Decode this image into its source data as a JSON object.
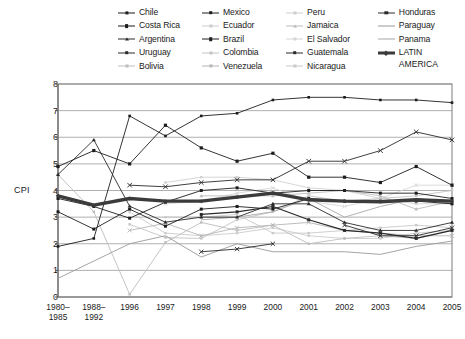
{
  "chart_data": {
    "type": "line",
    "title": "",
    "xlabel": "",
    "ylabel": "CPI",
    "ylim": [
      0,
      8
    ],
    "yticks": [
      0,
      1,
      2,
      3,
      4,
      5,
      6,
      7,
      8
    ],
    "grid": true,
    "legend_position": "top",
    "categories": [
      "1980–\n1985",
      "1988–\n1992",
      "1996",
      "1997",
      "1998",
      "1999",
      "2000",
      "2001",
      "2002",
      "2003",
      "2004",
      "2005"
    ],
    "category_labels": [
      [
        "1980–",
        "1985"
      ],
      [
        "1988–",
        "1992"
      ],
      [
        "1996",
        ""
      ],
      [
        "1997",
        ""
      ],
      [
        "1998",
        ""
      ],
      [
        "1999",
        ""
      ],
      [
        "2000",
        ""
      ],
      [
        "2001",
        ""
      ],
      [
        "2002",
        ""
      ],
      [
        "2003",
        ""
      ],
      [
        "2004",
        ""
      ],
      [
        "2005",
        ""
      ]
    ],
    "series": [
      {
        "name": "Chile",
        "color": "#1d1d1d",
        "width": 0.9,
        "marker": "square",
        "markersize": 2.6,
        "values": [
          1.9,
          2.2,
          6.8,
          6.05,
          6.8,
          6.9,
          7.4,
          7.5,
          7.5,
          7.4,
          7.4,
          7.3
        ]
      },
      {
        "name": "Costa Rica",
        "color": "#1d1d1d",
        "width": 0.9,
        "marker": "square",
        "markersize": 3.2,
        "values": [
          4.9,
          5.5,
          5.0,
          6.45,
          5.6,
          5.1,
          5.4,
          4.5,
          4.5,
          4.3,
          4.9,
          4.2
        ]
      },
      {
        "name": "Argentina",
        "color": "#2a2a2a",
        "width": 0.9,
        "marker": "triangle",
        "markersize": 2.8,
        "values": [
          4.6,
          5.9,
          3.41,
          2.81,
          3.0,
          3.0,
          3.5,
          3.5,
          2.8,
          2.5,
          2.5,
          2.8
        ]
      },
      {
        "name": "Uruguay",
        "color": "#2a2a2a",
        "width": 0.9,
        "marker": "cross",
        "markersize": 3.0,
        "values": [
          null,
          null,
          4.2,
          4.14,
          4.3,
          4.4,
          4.4,
          5.1,
          5.1,
          5.5,
          6.2,
          5.9
        ]
      },
      {
        "name": "Bolivia",
        "color": "#bdbdbd",
        "width": 0.9,
        "marker": "square",
        "markersize": 2.4,
        "values": [
          4.6,
          3.2,
          0.1,
          2.05,
          2.8,
          2.5,
          2.7,
          2.0,
          2.2,
          2.3,
          2.2,
          2.5
        ]
      },
      {
        "name": "Mexico",
        "color": "#1d1d1d",
        "width": 0.9,
        "marker": "square",
        "markersize": 3.0,
        "values": [
          3.2,
          2.55,
          3.3,
          2.66,
          3.3,
          3.4,
          3.3,
          3.7,
          3.6,
          3.6,
          3.6,
          3.5
        ]
      },
      {
        "name": "Ecuador",
        "color": "#cccccc",
        "width": 0.9,
        "marker": "square",
        "markersize": 2.4,
        "values": [
          null,
          null,
          3.19,
          2.4,
          2.3,
          2.4,
          2.6,
          2.3,
          2.2,
          2.2,
          2.4,
          2.5
        ]
      },
      {
        "name": "Brazil",
        "color": "#1d1d1d",
        "width": 0.9,
        "marker": "square",
        "markersize": 3.0,
        "values": [
          3.7,
          3.4,
          2.96,
          3.56,
          4.0,
          4.1,
          3.9,
          4.0,
          4.0,
          3.9,
          3.9,
          3.7
        ]
      },
      {
        "name": "Colombia",
        "color": "#c4c4c4",
        "width": 0.9,
        "marker": "square",
        "markersize": 2.4,
        "values": [
          null,
          null,
          2.73,
          2.23,
          2.2,
          2.9,
          3.2,
          3.8,
          3.6,
          3.7,
          3.8,
          4.0
        ]
      },
      {
        "name": "Venezuela",
        "color": "#b5b5b5",
        "width": 0.9,
        "marker": "cross",
        "markersize": 2.6,
        "values": [
          null,
          null,
          2.5,
          2.77,
          2.3,
          2.6,
          2.7,
          2.8,
          2.5,
          2.4,
          2.3,
          2.3
        ]
      },
      {
        "name": "Peru",
        "color": "#d0d0d0",
        "width": 0.9,
        "marker": "square",
        "markersize": 2.4,
        "values": [
          null,
          null,
          null,
          4.3,
          4.5,
          4.5,
          4.4,
          4.1,
          4.0,
          3.7,
          3.5,
          3.5
        ]
      },
      {
        "name": "Jamaica",
        "color": "#bcbcbc",
        "width": 0.9,
        "marker": "triangle",
        "markersize": 2.6,
        "values": [
          null,
          null,
          null,
          null,
          3.8,
          3.8,
          3.8,
          3.9,
          4.0,
          3.8,
          3.3,
          3.6
        ]
      },
      {
        "name": "El Salvador",
        "color": "#d6d6d6",
        "width": 0.9,
        "marker": "cross",
        "markersize": 2.4,
        "values": [
          null,
          null,
          null,
          3.5,
          3.6,
          3.9,
          4.1,
          3.6,
          3.4,
          3.7,
          4.2,
          4.2
        ]
      },
      {
        "name": "Guatemala",
        "color": "#2a2a2a",
        "width": 1.2,
        "marker": "square",
        "markersize": 3.0,
        "values": [
          null,
          null,
          null,
          null,
          3.1,
          3.2,
          3.4,
          2.9,
          2.5,
          2.4,
          2.2,
          2.5
        ]
      },
      {
        "name": "Nicaragua",
        "color": "#c9c9c9",
        "width": 0.9,
        "marker": "square",
        "markersize": 2.4,
        "values": [
          null,
          null,
          null,
          3.0,
          3.0,
          3.1,
          2.4,
          2.4,
          2.5,
          2.6,
          2.7,
          2.6
        ]
      },
      {
        "name": "Honduras",
        "color": "#2a2a2a",
        "width": 0.9,
        "marker": "cross",
        "markersize": 2.8,
        "values": [
          null,
          null,
          null,
          null,
          1.7,
          1.8,
          2.0,
          null,
          2.7,
          2.3,
          2.3,
          2.6
        ]
      },
      {
        "name": "Paraguay",
        "color": "#9a9a9a",
        "width": 0.9,
        "marker": "none",
        "markersize": 0,
        "values": [
          0.7,
          1.35,
          2.0,
          2.3,
          1.5,
          2.0,
          1.7,
          1.7,
          1.7,
          1.6,
          1.9,
          2.1
        ]
      },
      {
        "name": "Panama",
        "color": "#a8a8a8",
        "width": 0.9,
        "marker": "none",
        "markersize": 0,
        "values": [
          null,
          null,
          null,
          null,
          2.9,
          3.0,
          3.2,
          3.7,
          3.0,
          3.4,
          3.7,
          3.5
        ]
      },
      {
        "name": "LATIN AMERICA",
        "color": "#3b3b3b",
        "width": 3.4,
        "marker": "diamond",
        "markersize": 3.0,
        "values": [
          3.8,
          3.45,
          3.7,
          3.6,
          3.6,
          3.75,
          3.9,
          3.65,
          3.6,
          3.58,
          3.65,
          3.6
        ]
      }
    ]
  },
  "legend": {
    "columns": [
      {
        "items": [
          {
            "label": "Chile",
            "series": 0
          },
          {
            "label": "Costa Rica",
            "series": 1
          },
          {
            "label": "Argentina",
            "series": 2
          },
          {
            "label": "Uruguay",
            "series": 3
          },
          {
            "label": "Bolivia",
            "series": 4
          }
        ]
      },
      {
        "items": [
          {
            "label": "Mexico",
            "series": 5
          },
          {
            "label": "Ecuador",
            "series": 6
          },
          {
            "label": "Brazil",
            "series": 7
          },
          {
            "label": "Colombia",
            "series": 8
          },
          {
            "label": "Venezuela",
            "series": 9
          }
        ]
      },
      {
        "items": [
          {
            "label": "Peru",
            "series": 10
          },
          {
            "label": "Jamaica",
            "series": 11
          },
          {
            "label": "El Salvador",
            "series": 12
          },
          {
            "label": "Guatemala",
            "series": 13
          },
          {
            "label": "Nicaragua",
            "series": 14
          }
        ]
      },
      {
        "items": [
          {
            "label": "Honduras",
            "series": 15
          },
          {
            "label": "Paraguay",
            "series": 16
          },
          {
            "label": "Panama",
            "series": 17
          },
          {
            "label": "LATIN",
            "series": 18,
            "sublabel": "AMERICA"
          }
        ]
      }
    ]
  },
  "axes": {
    "y_label": "CPI",
    "frame_color": "#888888",
    "grid_color": "#9c9c9c",
    "background": "#ffffff"
  }
}
